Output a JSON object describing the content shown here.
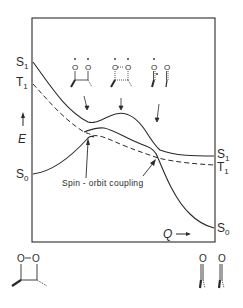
{
  "diagram": {
    "type": "potential-energy-surface",
    "y_axis": {
      "label": "E",
      "arrow": "up"
    },
    "x_axis": {
      "label": "Q",
      "arrow": "right"
    },
    "left_state_labels": [
      {
        "name": "S",
        "sub": "1"
      },
      {
        "name": "T",
        "sub": "1"
      },
      {
        "name": "S",
        "sub": "0"
      }
    ],
    "right_state_labels": [
      {
        "name": "S",
        "sub": "1"
      },
      {
        "name": "T",
        "sub": "1"
      },
      {
        "name": "S",
        "sub": "0"
      }
    ],
    "curves": [
      {
        "id": "S1",
        "style": "solid",
        "description": "Excited singlet: descends from high, local minimum, hump, then flattens"
      },
      {
        "id": "T1",
        "style": "dashed",
        "description": "Triplet: descends, crosses near S0 maximum, flattens"
      },
      {
        "id": "S0",
        "style": "solid",
        "description": "Ground singlet: rises to maximum near T1 crossing, then falls steeply"
      }
    ],
    "annotation": {
      "text": "Spin - orbit coupling",
      "arrows": 2
    },
    "structures": {
      "reactant": {
        "label": "O-O",
        "atoms": [
          "O",
          "O"
        ],
        "description": "1,2-dioxetane ring"
      },
      "products": {
        "atoms": [
          "O",
          "O"
        ],
        "description": "two carbonyl fragments"
      },
      "intermediates": [
        {
          "description": "biradical with C-C bond",
          "atoms": [
            "O",
            "O"
          ]
        },
        {
          "description": "O..O partially bonded transition",
          "atoms": [
            "O",
            "O"
          ]
        },
        {
          "description": "separated carbonyls",
          "atoms": [
            "O",
            "O"
          ]
        }
      ]
    }
  }
}
